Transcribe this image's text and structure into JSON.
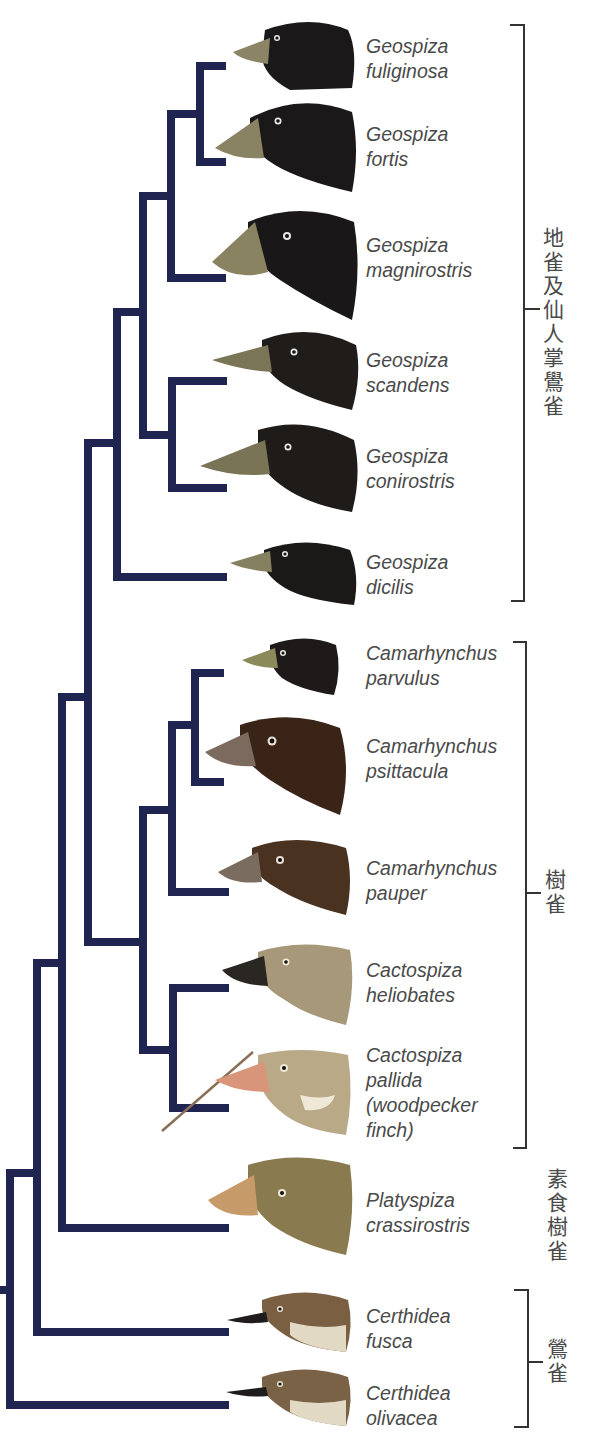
{
  "diagram": {
    "type": "phylogenetic-tree",
    "line_color": "#1f2550",
    "bracket_color": "#333333",
    "text_color": "#4a4a4a"
  },
  "species": [
    {
      "genus": "Geospiza",
      "epithet": "fuliginosa",
      "extra": "",
      "head_color": "#1a1818",
      "beak_color": "#8c8466",
      "y": 44
    },
    {
      "genus": "Geospiza",
      "epithet": "fortis",
      "extra": "",
      "head_color": "#1a1818",
      "beak_color": "#8a8363",
      "y": 139
    },
    {
      "genus": "Geospiza",
      "epithet": "magnirostris",
      "extra": "",
      "head_color": "#191717",
      "beak_color": "#8a8362",
      "y": 245
    },
    {
      "genus": "Geospiza",
      "epithet": "scandens",
      "extra": "",
      "head_color": "#201c1a",
      "beak_color": "#7b7558",
      "y": 361
    },
    {
      "genus": "Geospiza",
      "epithet": "conirostris",
      "extra": "",
      "head_color": "#1e1b19",
      "beak_color": "#7a7457",
      "y": 457
    },
    {
      "genus": "Geospiza",
      "epithet": "dicilis",
      "extra": "",
      "head_color": "#1b1918",
      "beak_color": "#85805f",
      "y": 563
    },
    {
      "genus": "Camarhynchus",
      "epithet": "parvulus",
      "extra": "",
      "head_color": "#1d1a19",
      "beak_color": "#8a8a5a",
      "y": 655
    },
    {
      "genus": "Camarhynchus",
      "epithet": "psittacula",
      "extra": "",
      "head_color": "#3a2418",
      "beak_color": "#7d6a5e",
      "y": 746
    },
    {
      "genus": "Camarhynchus",
      "epithet": "pauper",
      "extra": "",
      "head_color": "#4a3220",
      "beak_color": "#7b6c60",
      "y": 860
    },
    {
      "genus": "Cactospiza",
      "epithet": "heliobates",
      "extra": "",
      "head_color": "#a69878",
      "beak_color": "#2a2622",
      "y": 963
    },
    {
      "genus": "Cactospiza",
      "epithet": "pallida",
      "extra": "(woodpecker finch)",
      "head_color": "#b9a987",
      "beak_color": "#d8957a",
      "y": 1050
    },
    {
      "genus": "Platyspiza",
      "epithet": "crassirostris",
      "extra": "",
      "head_color": "#8a7a50",
      "beak_color": "#c79a6a",
      "y": 1191
    },
    {
      "genus": "Certhidea",
      "epithet": "fusca",
      "extra": "",
      "head_color": "#7a5f42",
      "beak_color": "#1e1c1c",
      "y": 1305
    },
    {
      "genus": "Certhidea",
      "epithet": "olivacea",
      "extra": "",
      "head_color": "#7a6246",
      "beak_color": "#1e1c1c",
      "y": 1382
    }
  ],
  "groups": [
    {
      "label": "地雀及仙人掌鷽雀",
      "meaning": "ground finches and cactus finches",
      "bracket_top": 25,
      "bracket_bottom": 601,
      "tick_y": 309
    },
    {
      "label": "樹雀",
      "meaning": "tree finches",
      "bracket_top": 642,
      "bracket_bottom": 1148,
      "tick_y": 893
    },
    {
      "label": "素食樹雀",
      "meaning": "vegetarian tree finch",
      "bracket_top": null,
      "bracket_bottom": null,
      "tick_y": null
    },
    {
      "label": "鶯雀",
      "meaning": "warbler finches",
      "bracket_top": 1290,
      "bracket_bottom": 1427,
      "tick_y": 1362
    }
  ]
}
